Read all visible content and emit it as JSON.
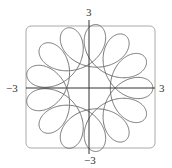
{
  "chart_data": {
    "type": "line",
    "title": "",
    "xlabel": "",
    "ylabel": "",
    "xlim": [
      -3,
      3
    ],
    "ylim": [
      -3,
      3
    ],
    "grid": false,
    "frame": "rounded-box",
    "tick_labels": {
      "x_min": "−3",
      "x_max": "3",
      "y_min": "−3",
      "y_max": "3"
    },
    "series": [
      {
        "name": "parametric curve",
        "kind": "parametric rosette",
        "x_expr": "2cos(t) + cos(5.5 t)",
        "y_expr": "2sin(t) - sin(5.5 t)",
        "t_range": [
          0,
          12.566
        ],
        "color": "#666666"
      }
    ]
  },
  "colors": {
    "curve": "#666666",
    "axes": "#333333",
    "frame": "#aaaaaa"
  }
}
